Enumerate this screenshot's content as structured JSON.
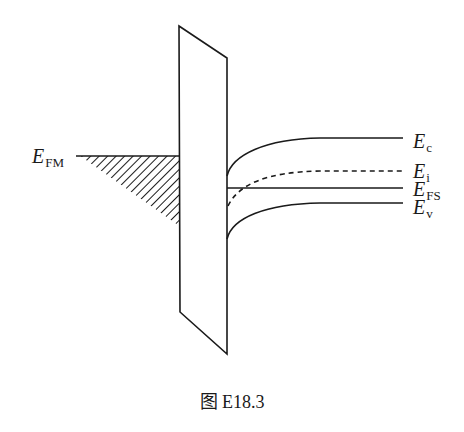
{
  "figure": {
    "caption": "图 E18.3",
    "labels": {
      "efm": {
        "main": "E",
        "sub": "FM"
      },
      "ec": {
        "main": "E",
        "sub": "c"
      },
      "ei": {
        "main": "E",
        "sub": "i"
      },
      "efs": {
        "main": "E",
        "sub": "FS"
      },
      "ev": {
        "main": "E",
        "sub": "v"
      }
    },
    "colors": {
      "line": "#1a1a1a",
      "background": "#ffffff"
    }
  }
}
